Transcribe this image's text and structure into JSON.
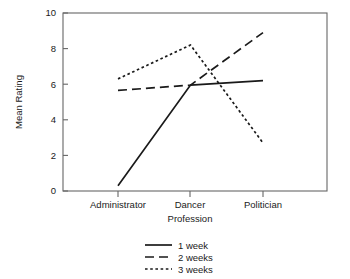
{
  "chart_data": {
    "type": "line",
    "title": "",
    "xlabel": "Profession",
    "ylabel": "Mean Rating",
    "categories": [
      "Administrator",
      "Dancer",
      "Politician"
    ],
    "series": [
      {
        "name": "1 week",
        "values": [
          0.3,
          5.95,
          6.2
        ],
        "style": "solid"
      },
      {
        "name": "2 weeks",
        "values": [
          5.65,
          5.95,
          8.9
        ],
        "style": "dashed"
      },
      {
        "name": "3 weeks",
        "values": [
          6.3,
          8.2,
          2.7
        ],
        "style": "dotted"
      }
    ],
    "ylim": [
      0,
      10
    ],
    "yticks": [
      0,
      2,
      4,
      6,
      8,
      10
    ],
    "ytick_labels": [
      "0",
      "2",
      "4",
      "6",
      "8",
      "10"
    ],
    "grid": false,
    "legend_position": "bottom-center",
    "legend_entries": [
      "1 week",
      "2 weeks",
      "3 weeks"
    ],
    "frame": "box",
    "line_color": "#1a1a1a",
    "axis_color": "#666666",
    "background": "#ffffff"
  },
  "axis": {
    "ylabel": "Mean Rating",
    "xlabel": "Profession",
    "ytick_0": "0",
    "ytick_1": "2",
    "ytick_2": "4",
    "ytick_3": "6",
    "ytick_4": "8",
    "ytick_5": "10",
    "xtick_0": "Administrator",
    "xtick_1": "Dancer",
    "xtick_2": "Politician"
  },
  "legend": {
    "item_0": "1 week",
    "item_1": "2 weeks",
    "item_2": "3 weeks"
  }
}
